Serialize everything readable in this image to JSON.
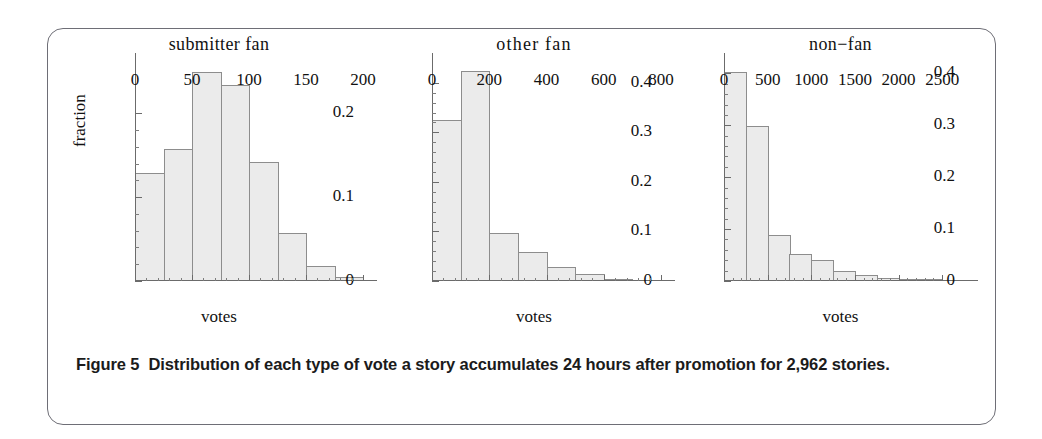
{
  "figure": {
    "caption_label": "Figure 5",
    "caption_text": "Distribution of each type of vote a story accumulates 24 hours after promotion for 2,962 stories.",
    "shared_ylabel": "fraction",
    "shared_xlabel": "votes",
    "bar_fill": "#ebebeb",
    "bar_stroke": "#8d8d8d",
    "axis_color": "#6b6b6b",
    "frame_color": "#6e6e76"
  },
  "chart_data": [
    {
      "type": "bar",
      "title": "submitter fan",
      "xlabel": "votes",
      "ylabel": "fraction",
      "grid": false,
      "xlim": [
        0,
        200
      ],
      "ylim": [
        0,
        0.26
      ],
      "xticks": [
        0,
        50,
        100,
        150,
        200
      ],
      "xtick_labels": [
        "0",
        "50",
        "100",
        "150",
        "200"
      ],
      "yticks": [
        0,
        0.1,
        0.2
      ],
      "ytick_labels": [
        "0",
        "0.1",
        "0.2"
      ],
      "bin_width": 25,
      "bin_edges": [
        0,
        25,
        50,
        75,
        100,
        125,
        150,
        175,
        200
      ],
      "categories": [
        "0-25",
        "25-50",
        "50-75",
        "75-100",
        "100-125",
        "125-150",
        "150-175",
        "175-200"
      ],
      "values": [
        0.129,
        0.158,
        0.249,
        0.234,
        0.142,
        0.057,
        0.018,
        0.005
      ]
    },
    {
      "type": "bar",
      "title": "other fan",
      "xlabel": "votes",
      "ylabel": "fraction",
      "grid": false,
      "xlim": [
        0,
        800
      ],
      "ylim": [
        0,
        0.44
      ],
      "xticks": [
        0,
        200,
        400,
        600,
        800
      ],
      "xtick_labels": [
        "0",
        "200",
        "400",
        "600",
        "800"
      ],
      "yticks": [
        0,
        0.1,
        0.2,
        0.3,
        0.4
      ],
      "ytick_labels": [
        "0",
        "0.1",
        "0.2",
        "0.3",
        "0.4"
      ],
      "bin_width": 100,
      "bin_edges": [
        0,
        100,
        200,
        300,
        400,
        500,
        600,
        700,
        800
      ],
      "categories": [
        "0-100",
        "100-200",
        "200-300",
        "300-400",
        "400-500",
        "500-600",
        "600-700",
        "700-800"
      ],
      "values": [
        0.325,
        0.423,
        0.097,
        0.058,
        0.028,
        0.0135,
        0.005,
        0.0025
      ]
    },
    {
      "type": "bar",
      "title": "non−fan",
      "xlabel": "votes",
      "ylabel": "fraction",
      "grid": false,
      "xlim": [
        0,
        2750
      ],
      "ylim": [
        0,
        0.42
      ],
      "xticks": [
        0,
        500,
        1000,
        1500,
        2000,
        2500
      ],
      "xtick_labels": [
        "0",
        "500",
        "1000",
        "1500",
        "2000",
        "2500"
      ],
      "yticks": [
        0,
        0.1,
        0.2,
        0.3,
        0.4
      ],
      "ytick_labels": [
        "0",
        "0.1",
        "0.2",
        "0.3",
        "0.4"
      ],
      "bin_width": 250,
      "bin_edges": [
        0,
        250,
        500,
        750,
        1000,
        1250,
        1500,
        1750,
        2000,
        2250,
        2500,
        2750
      ],
      "categories": [
        "0-250",
        "250-500",
        "500-750",
        "750-1000",
        "1000-1250",
        "1250-1500",
        "1500-1750",
        "1750-2000",
        "2000-2250",
        "2250-2500",
        "2500-2750"
      ],
      "values": [
        0.402,
        0.299,
        0.088,
        0.053,
        0.041,
        0.02,
        0.011,
        0.006,
        0.004,
        0.003,
        0.001
      ]
    }
  ]
}
